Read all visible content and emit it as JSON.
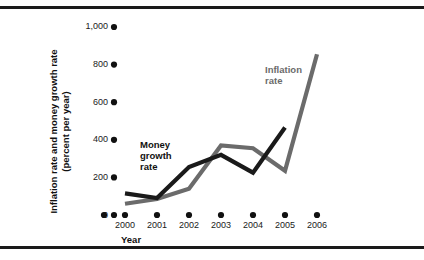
{
  "figure": {
    "background_color": "#ffffff",
    "rule_color": "#1a1a1a"
  },
  "axes": {
    "y_title_line1": "Inflation rate and money growth rate",
    "y_title_line2": "(percent per year)",
    "x_title": "Year",
    "y_tick_labels": [
      "1,000",
      "800",
      "600",
      "400",
      "200",
      "0"
    ],
    "x_tick_labels": [
      "2000",
      "2001",
      "2002",
      "2003",
      "2004",
      "2005",
      "2006"
    ]
  },
  "labels": {
    "money_growth_line1": "Money",
    "money_growth_line2": "growth",
    "money_growth_line3": "rate",
    "inflation_line1": "Inflation",
    "inflation_line2": "rate"
  },
  "chart_data": {
    "type": "line",
    "title": "",
    "xlabel": "Year",
    "ylabel": "Inflation rate and money growth rate (percent per year)",
    "x": [
      2000,
      2001,
      2002,
      2003,
      2004,
      2005,
      2006
    ],
    "xlim": [
      2000,
      2006
    ],
    "ylim": [
      0,
      1000
    ],
    "yticks": [
      0,
      200,
      400,
      600,
      800,
      1000
    ],
    "ytick_labels": [
      "0",
      "200",
      "400",
      "600",
      "800",
      "1,000"
    ],
    "grid": false,
    "legend_position": "inline-annotations",
    "series": [
      {
        "name": "Money growth rate",
        "color": "#1a1a1a",
        "x": [
          2000,
          2001,
          2002,
          2003,
          2004,
          2005
        ],
        "values": [
          115,
          90,
          255,
          320,
          225,
          465
        ]
      },
      {
        "name": "Inflation rate",
        "color": "#6b6b6b",
        "x": [
          2000,
          2001,
          2002,
          2003,
          2004,
          2005,
          2006
        ],
        "values": [
          60,
          85,
          140,
          370,
          355,
          235,
          855
        ]
      }
    ],
    "annotations": [
      {
        "text": "Money growth rate",
        "x": 2000.5,
        "y": 430
      },
      {
        "text": "Inflation rate",
        "x": 2004.3,
        "y": 790
      }
    ]
  }
}
